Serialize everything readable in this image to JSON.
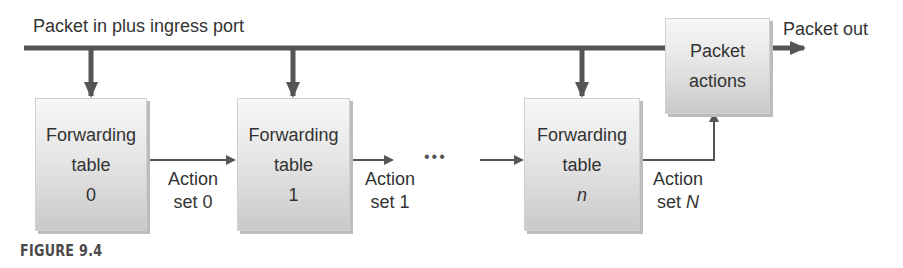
{
  "diagram": {
    "input_label": "Packet in plus ingress port",
    "output_label": "Packet out",
    "packet_actions": {
      "line1": "Packet",
      "line2": "actions"
    },
    "tables": [
      {
        "line1": "Forwarding",
        "line2": "table",
        "index": "0"
      },
      {
        "line1": "Forwarding",
        "line2": "table",
        "index": "1"
      },
      {
        "line1": "Forwarding",
        "line2": "table",
        "index": "n"
      }
    ],
    "action_sets": [
      {
        "line1": "Action",
        "line2_prefix": "set ",
        "line2_var": "0"
      },
      {
        "line1": "Action",
        "line2_prefix": "set ",
        "line2_var": "1"
      },
      {
        "line1": "Action",
        "line2_prefix": "set ",
        "line2_var": "N"
      }
    ],
    "ellipsis": "•••",
    "caption": "FIGURE 9.4",
    "colors": {
      "line": "#555555",
      "text": "#333333",
      "box_top": "#f7f7f7",
      "box_bottom": "#c9c9c9"
    }
  }
}
